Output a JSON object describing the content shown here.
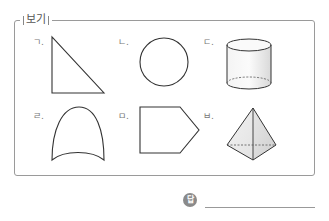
{
  "box": {
    "title": "보기",
    "items": [
      {
        "label": "ㄱ.",
        "shape": "right-triangle"
      },
      {
        "label": "ㄴ.",
        "shape": "circle"
      },
      {
        "label": "ㄷ.",
        "shape": "cylinder"
      },
      {
        "label": "ㄹ.",
        "shape": "curved-arch"
      },
      {
        "label": "ㅁ.",
        "shape": "pentagon"
      },
      {
        "label": "ㅂ.",
        "shape": "triangular-pyramid"
      }
    ]
  },
  "answer": {
    "icon_text": "답",
    "value": ""
  }
}
